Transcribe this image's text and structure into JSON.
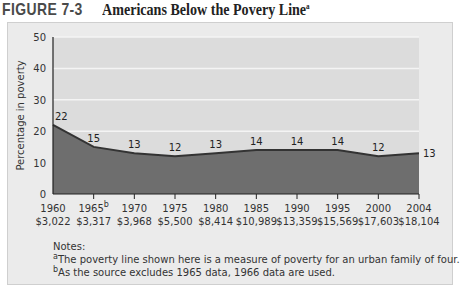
{
  "figure": {
    "label": "FIGURE 7-3",
    "title": "Americans Below the Povery Line",
    "title_superscript": "a"
  },
  "chart_data": {
    "type": "area",
    "title": "Americans Below the Povery Line",
    "xlabel": "",
    "ylabel": "Percentage in poverty",
    "ylim": [
      0,
      50
    ],
    "yticks": [
      0,
      10,
      20,
      30,
      40,
      50
    ],
    "grid": true,
    "legend": "none",
    "categories": [
      "1960",
      "1965",
      "1970",
      "1975",
      "1980",
      "1985",
      "1990",
      "1995",
      "2000",
      "2004"
    ],
    "category_superscripts": [
      "",
      "b",
      "",
      "",
      "",
      "",
      "",
      "",
      "",
      ""
    ],
    "poverty_line": [
      "$3,022",
      "$3,317",
      "$3,968",
      "$5,500",
      "$8,414",
      "$10,989",
      "$13,359",
      "$15,569",
      "$17,603",
      "$18,104"
    ],
    "values": [
      22,
      15,
      13,
      12,
      13,
      14,
      14,
      14,
      12,
      13
    ],
    "data_labels": [
      "22",
      "15",
      "13",
      "12",
      "13",
      "14",
      "14",
      "14",
      "12",
      "13"
    ]
  },
  "colors": {
    "panel_bg": "#ebebeb",
    "plot_bg": "#dcdcdc",
    "area_fill": "#6e6e6e",
    "line": "#333333",
    "grid": "#f4f4f4"
  },
  "notes": {
    "heading": "Notes:",
    "items": [
      {
        "marker": "a",
        "text": "The poverty line shown here is a measure of poverty for an urban family of four."
      },
      {
        "marker": "b",
        "text": "As the source excludes 1965 data, 1966 data are used."
      }
    ]
  }
}
